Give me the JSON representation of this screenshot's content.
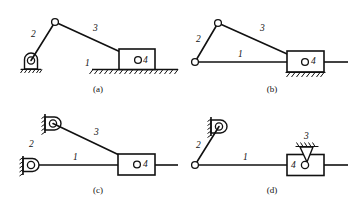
{
  "figure": {
    "type": "mechanism-kinematic-diagram",
    "link_numbers": {
      "frame": "1",
      "crank": "2",
      "coupler": "3",
      "slider": "4"
    },
    "panels": [
      {
        "id": "a",
        "caption": "(a)",
        "labels": {
          "crank": "2",
          "coupler": "3",
          "frame": "1",
          "slider": "4"
        },
        "elements": [
          "fixed-pivot-on-ground",
          "crank-link",
          "coupler-link",
          "slider-block-on-hatched-ground",
          "ground-hatching"
        ]
      },
      {
        "id": "b",
        "caption": "(b)",
        "labels": {
          "crank": "2",
          "coupler": "3",
          "frame": "1",
          "slider": "4"
        },
        "elements": [
          "pin-joint-open-circle",
          "crank-link",
          "coupler-link",
          "frame-line",
          "slider-block-with-hatching-below",
          "guide-line"
        ]
      },
      {
        "id": "c",
        "caption": "(c)",
        "labels": {
          "crank": "2",
          "coupler": "3",
          "frame": "1",
          "slider": "4"
        },
        "elements": [
          "upper-fixed-pivot-bracket-wall",
          "lower-fixed-pivot-bracket-wall",
          "coupler-link",
          "frame-line",
          "slider-block",
          "guide-line"
        ]
      },
      {
        "id": "d",
        "caption": "(d)",
        "labels": {
          "crank": "2",
          "coupler": "3",
          "frame": "1",
          "slider": "4"
        },
        "elements": [
          "fixed-pivot-bracket-wall",
          "crank-link",
          "pin-joint-open-circle",
          "frame-line",
          "slider-block",
          "fixed-pivot-hatched-triangle-on-block",
          "guide-line"
        ]
      }
    ]
  },
  "colors": {
    "line": "#111111",
    "background": "#ffffff",
    "fill": "#ffffff"
  }
}
